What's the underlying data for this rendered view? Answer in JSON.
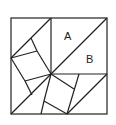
{
  "diagram": {
    "type": "square-dissection",
    "labels": {
      "a": "A",
      "b": "B"
    },
    "stroke_color": "#222222",
    "background": "#ffffff"
  }
}
